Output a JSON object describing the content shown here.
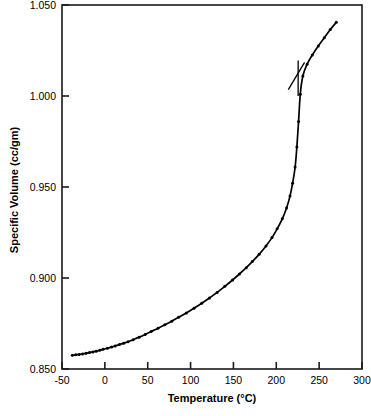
{
  "chart_data": {
    "type": "line",
    "title": "",
    "xlabel": "Temperature (°C)",
    "ylabel": "Specific Volume (cc/gm)",
    "xlim": [
      -50,
      300
    ],
    "ylim": [
      0.85,
      1.05
    ],
    "xticks": [
      -50,
      0,
      50,
      100,
      150,
      200,
      250,
      300
    ],
    "xticklabels": [
      "-50",
      "0",
      "50",
      "100",
      "150",
      "200",
      "250",
      "300"
    ],
    "yticks": [
      0.85,
      0.9,
      0.95,
      1.0,
      1.05
    ],
    "yticklabels": [
      "0.850",
      "0.900",
      "0.950",
      "1.000",
      "1.050"
    ],
    "grid": false,
    "legend": null,
    "frame": "full-box",
    "series": [
      {
        "name": "specific volume",
        "marker": "filled-circle",
        "line": "solid",
        "color": "#000000",
        "x": [
          -38,
          -34,
          -30,
          -26,
          -22,
          -18,
          -14,
          -10,
          -6,
          -2,
          3,
          8,
          12,
          17,
          22,
          27,
          33,
          40,
          47,
          54,
          62,
          70,
          78,
          86,
          95,
          104,
          113,
          122,
          131,
          140,
          149,
          157,
          165,
          172,
          180,
          188,
          195,
          201,
          207,
          212,
          216,
          219,
          222,
          224,
          226,
          228,
          231,
          236,
          242,
          249,
          256,
          263,
          270
        ],
        "y": [
          0.8575,
          0.8578,
          0.858,
          0.8583,
          0.8586,
          0.859,
          0.8594,
          0.8598,
          0.8603,
          0.8608,
          0.8614,
          0.8621,
          0.8627,
          0.8634,
          0.8642,
          0.865,
          0.8661,
          0.8675,
          0.869,
          0.8706,
          0.8724,
          0.8743,
          0.8763,
          0.8784,
          0.8808,
          0.8834,
          0.8861,
          0.889,
          0.8921,
          0.8954,
          0.8989,
          0.9022,
          0.9057,
          0.909,
          0.913,
          0.9176,
          0.9222,
          0.927,
          0.9325,
          0.9385,
          0.945,
          0.952,
          0.961,
          0.972,
          0.986,
          1.001,
          1.011,
          1.0175,
          1.0225,
          1.0275,
          1.032,
          1.0365,
          1.0405
        ]
      }
    ],
    "construction_lines": [
      {
        "name": "liquid-branch-tangent",
        "x": [
          214,
          233
        ],
        "y": [
          1.0035,
          1.0185
        ]
      },
      {
        "name": "melting-point-riser",
        "x": [
          225.5,
          225.5
        ],
        "y": [
          1.0,
          1.0195
        ]
      }
    ],
    "annotations": []
  },
  "axes": {
    "frame_color": "#1a1a1a"
  }
}
